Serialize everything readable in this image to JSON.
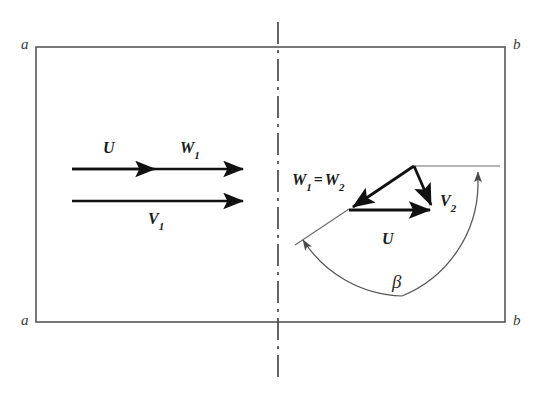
{
  "figure": {
    "background_color": "#ffffff",
    "line_color": "#333333",
    "vector_color": "#111111",
    "thin_line_color": "#555555",
    "width": 544,
    "height": 401
  },
  "duct": {
    "corner_labels": {
      "top_left": "a",
      "top_right": "b",
      "bottom_left": "a",
      "bottom_right": "b"
    }
  },
  "centerline": {
    "name": "blade-row-centerline",
    "style": "dash-dot"
  },
  "upstream": {
    "vectors": [
      {
        "id": "U",
        "label": "U",
        "subscript": ""
      },
      {
        "id": "W1",
        "label": "W",
        "subscript": "1"
      },
      {
        "id": "V1",
        "label": "V",
        "subscript": "1"
      }
    ]
  },
  "downstream": {
    "triangle_labels": {
      "relative": {
        "label_a": "W",
        "sub_a": "1",
        "equals": "=",
        "label_b": "W",
        "sub_b": "2"
      },
      "absolute": {
        "label": "V",
        "subscript": "2"
      },
      "blade_speed": {
        "label": "U",
        "subscript": ""
      }
    },
    "angle": {
      "label": "β",
      "name": "beta"
    }
  }
}
